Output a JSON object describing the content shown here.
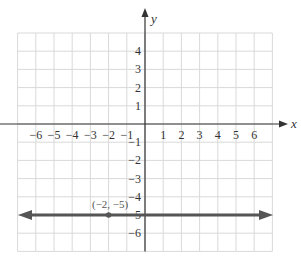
{
  "chart_data": {
    "type": "line",
    "title": "",
    "xlabel": "x",
    "ylabel": "y",
    "xlim": [
      -7,
      7
    ],
    "ylim": [
      -7,
      5
    ],
    "grid": true,
    "x_ticks": [
      "−6",
      "−5",
      "−4",
      "−3",
      "−2",
      "−1",
      "1",
      "2",
      "3",
      "4",
      "5",
      "6"
    ],
    "y_ticks": [
      "4",
      "3",
      "2",
      "1",
      "−1",
      "−2",
      "−3",
      "−4",
      "−5",
      "−6"
    ],
    "series": [
      {
        "name": "y = −5",
        "kind": "horizontal-line",
        "y": -5,
        "color": "#555555",
        "arrows": "both"
      }
    ],
    "points": [
      {
        "x": -2,
        "y": -5,
        "label": "(−2, −5)"
      }
    ]
  },
  "colors": {
    "grid": "#d9d9d9",
    "axis": "#333333",
    "line": "#555555"
  }
}
